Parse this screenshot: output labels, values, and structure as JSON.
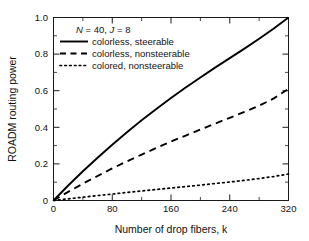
{
  "chart_data": {
    "type": "line",
    "title": "",
    "xlabel": "Number of drop fibers, k",
    "ylabel": "ROADM routing power",
    "xlim": [
      0,
      320
    ],
    "ylim": [
      0,
      1.0
    ],
    "xticks": [
      0,
      80,
      160,
      240,
      320
    ],
    "yticks": [
      0,
      0.2,
      0.4,
      0.6,
      0.8,
      1.0
    ],
    "xtick_labels": [
      "0",
      "80",
      "160",
      "240",
      "320"
    ],
    "ytick_labels": [
      "0",
      "0.2",
      "0.4",
      "0.6",
      "0.8",
      "1.0"
    ],
    "grid": false,
    "legend_position": "upper-left-inside",
    "annotation": "N = 40, J = 8",
    "annotation_parts": {
      "n_symbol": "N",
      "n_value": " = 40, ",
      "j_symbol": "J",
      "j_value": " = 8"
    },
    "x": [
      0,
      20,
      40,
      60,
      80,
      100,
      120,
      140,
      160,
      180,
      200,
      220,
      240,
      260,
      280,
      300,
      320
    ],
    "series": [
      {
        "name": "colorless, steerable",
        "style": "solid",
        "color": "#000000",
        "values": [
          0,
          0.082,
          0.16,
          0.234,
          0.305,
          0.373,
          0.438,
          0.5,
          0.56,
          0.617,
          0.672,
          0.726,
          0.778,
          0.83,
          0.884,
          0.94,
          1.0
        ]
      },
      {
        "name": "colorless, nonsteerable",
        "style": "dashed",
        "color": "#000000",
        "values": [
          0,
          0.047,
          0.092,
          0.134,
          0.175,
          0.214,
          0.251,
          0.287,
          0.322,
          0.355,
          0.388,
          0.42,
          0.452,
          0.484,
          0.518,
          0.558,
          0.61
        ]
      },
      {
        "name": "colored, nonsteerable",
        "style": "dotted",
        "color": "#000000",
        "values": [
          0,
          0.009,
          0.018,
          0.027,
          0.035,
          0.044,
          0.052,
          0.06,
          0.068,
          0.076,
          0.084,
          0.093,
          0.101,
          0.11,
          0.12,
          0.131,
          0.145
        ]
      }
    ]
  },
  "legend": {
    "entries": [
      {
        "label": "colorless, steerable"
      },
      {
        "label": "colorless, nonsteerable"
      },
      {
        "label": "colored, nonsteerable"
      }
    ]
  }
}
